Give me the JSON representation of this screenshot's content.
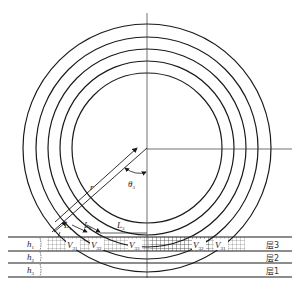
{
  "diagram": {
    "center": [
      147,
      148
    ],
    "radii": [
      75,
      87,
      99,
      111,
      124
    ],
    "colors": {
      "line": "#1a1a1a",
      "background": "#ffffff",
      "hatch": "#444444"
    },
    "labels": {
      "radius": "r",
      "angle": "θ",
      "angle_sub": "3",
      "L1": "L",
      "L1_sub": "1",
      "L2": "L",
      "L2_sub": "2",
      "L3": "L",
      "L3_sub": "3",
      "V31": "V",
      "V31_sub": "31",
      "V32": "V",
      "V32_sub": "32",
      "V33": "V",
      "V33_sub": "33",
      "V32r": "V",
      "V32r_sub": "32",
      "V31r": "V",
      "V31r_sub": "31"
    },
    "layers": [
      {
        "thickness_label": "h",
        "thickness_sub": "1",
        "name": "层3"
      },
      {
        "thickness_label": "h",
        "thickness_sub": "2",
        "name": "层2"
      },
      {
        "thickness_label": "h",
        "thickness_sub": "3",
        "name": "层1"
      }
    ]
  }
}
